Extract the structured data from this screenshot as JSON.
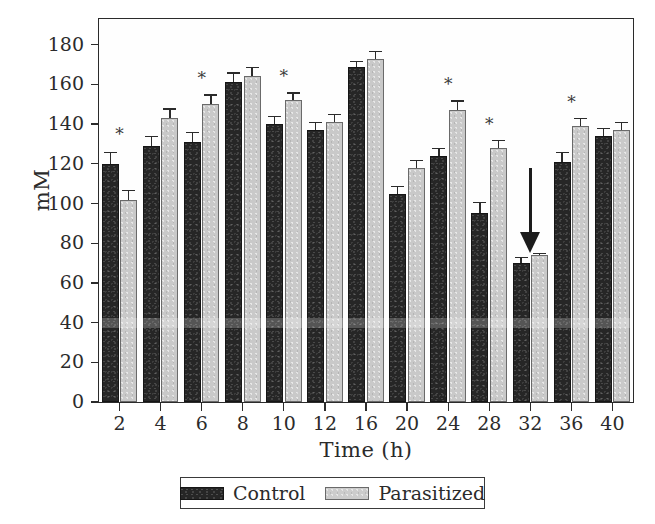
{
  "chart_data": {
    "type": "bar",
    "title": "",
    "xlabel": "Time (h)",
    "ylabel": "mM",
    "categories": [
      "2",
      "4",
      "6",
      "8",
      "10",
      "12",
      "16",
      "20",
      "24",
      "28",
      "32",
      "36",
      "40"
    ],
    "ylim": [
      0,
      180
    ],
    "yticks": [
      0,
      20,
      40,
      60,
      80,
      100,
      120,
      140,
      160,
      180
    ],
    "grid": false,
    "legend_position": "bottom",
    "series": [
      {
        "name": "Control",
        "color": "#262626",
        "values": [
          120,
          129,
          131,
          161,
          140,
          137,
          169,
          105,
          124,
          95,
          70,
          121,
          134
        ],
        "errors": [
          6,
          5,
          5,
          5,
          4,
          4,
          3,
          4,
          4,
          6,
          3,
          5,
          4
        ]
      },
      {
        "name": "Parasitized",
        "color": "#c9c9c9",
        "values": [
          102,
          143,
          150,
          164,
          152,
          141,
          173,
          118,
          147,
          128,
          74,
          139,
          137
        ],
        "errors": [
          5,
          5,
          5,
          5,
          4,
          4,
          4,
          4,
          5,
          4,
          1,
          4,
          4
        ]
      }
    ],
    "annotations": {
      "significance_marker": "*",
      "significant_categories": [
        "2",
        "6",
        "10",
        "24",
        "28",
        "36"
      ],
      "arrow": {
        "label": "arrow-annotation",
        "points_to_category": "32",
        "direction": "down"
      }
    }
  },
  "legend": {
    "entries": [
      {
        "label": "Control",
        "swatch": "control-swatch"
      },
      {
        "label": "Parasitized",
        "swatch": "parasitized-swatch"
      }
    ]
  }
}
